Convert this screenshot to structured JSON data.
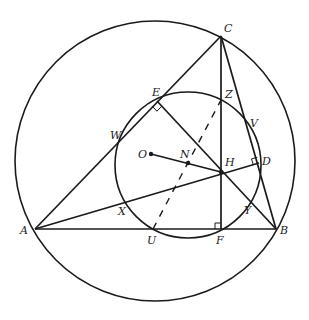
{
  "diagram": {
    "stroke_color": "#1a1a1a",
    "points": {
      "A": {
        "x": 35,
        "y": 229,
        "label": "A",
        "lx": 20,
        "ly": 234
      },
      "B": {
        "x": 276,
        "y": 229,
        "label": "B",
        "lx": 280,
        "ly": 234
      },
      "C": {
        "x": 221,
        "y": 36,
        "label": "C",
        "lx": 224,
        "ly": 32
      },
      "D": {
        "x": 259,
        "y": 163,
        "label": "D",
        "lx": 262,
        "ly": 165
      },
      "E": {
        "x": 157,
        "y": 101,
        "label": "E",
        "lx": 152,
        "ly": 96
      },
      "F": {
        "x": 221,
        "y": 229,
        "label": "F",
        "lx": 216,
        "ly": 244
      },
      "H": {
        "x": 221,
        "y": 172,
        "label": "H",
        "lx": 225,
        "ly": 166
      },
      "N": {
        "x": 188,
        "y": 163,
        "label": "N",
        "lx": 180,
        "ly": 158
      },
      "O": {
        "x": 151,
        "y": 154,
        "label": "O",
        "lx": 138,
        "ly": 158
      },
      "U": {
        "x": 153,
        "y": 229,
        "label": "U",
        "lx": 147,
        "ly": 244
      },
      "V": {
        "x": 248,
        "y": 122,
        "label": "V",
        "lx": 250,
        "ly": 127
      },
      "W": {
        "x": 120,
        "y": 140,
        "label": "W",
        "lx": 110,
        "ly": 139
      },
      "X": {
        "x": 125,
        "y": 201,
        "label": "X",
        "lx": 118,
        "ly": 215
      },
      "Y": {
        "x": 251,
        "y": 203,
        "label": "Y",
        "lx": 244,
        "ly": 214
      },
      "Z": {
        "x": 221,
        "y": 100,
        "label": "Z",
        "lx": 225,
        "ly": 98
      }
    },
    "circles": [
      {
        "name": "circumcircle",
        "cx": 155,
        "cy": 161,
        "r": 140
      },
      {
        "name": "nine-point-circle",
        "cx": 188,
        "cy": 165,
        "r": 73
      }
    ],
    "segments": [
      {
        "from": "A",
        "to": "B",
        "style": "solid"
      },
      {
        "from": "B",
        "to": "C",
        "style": "solid"
      },
      {
        "from": "C",
        "to": "A",
        "style": "solid"
      },
      {
        "from": "C",
        "to": "F",
        "style": "solid"
      },
      {
        "from": "A",
        "to": "D",
        "style": "solid"
      },
      {
        "from": "B",
        "to": "E",
        "style": "solid"
      },
      {
        "from": "O",
        "to": "H",
        "style": "solid"
      },
      {
        "from": "U",
        "to": "Z",
        "style": "dashed"
      }
    ],
    "right_angle_marks": [
      "E",
      "D",
      "F"
    ]
  }
}
